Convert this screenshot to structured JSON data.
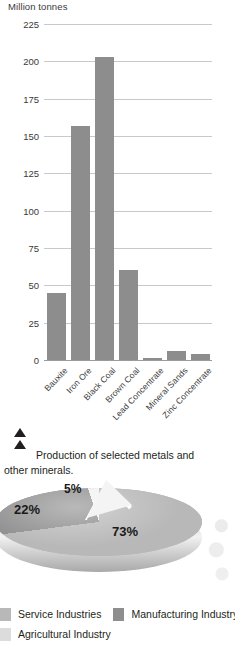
{
  "bar_figure": {
    "axis_title": "Million tonnes",
    "caption": "Production of selected metals and other minerals.",
    "marker_icon": "double-triangle-up-icon"
  },
  "legend": {
    "items": [
      {
        "label": "Service Industries",
        "color": "#b8b8b8"
      },
      {
        "label": "Manufacturing Industry",
        "color": "#8e8e8e"
      },
      {
        "label": "Agricultural Industry",
        "color": "#dcdcdc"
      }
    ]
  },
  "chart_data": [
    {
      "type": "bar",
      "title": "Production of selected metals and other minerals.",
      "xlabel": "",
      "ylabel": "Million tonnes",
      "ylim": [
        0,
        225
      ],
      "yticks": [
        0,
        25,
        50,
        75,
        100,
        125,
        150,
        175,
        200,
        225
      ],
      "grid": true,
      "legend": "none",
      "bar_color": "#8d8d8d",
      "categories": [
        "Bauxite",
        "Iron Ore",
        "Black Coal",
        "Brown Coal",
        "Lead Concentrate",
        "Mineral Sands",
        "Zinc Concentrate"
      ],
      "values": [
        45,
        157,
        203,
        60,
        1.5,
        6,
        4
      ]
    },
    {
      "type": "pie",
      "title": "",
      "labels": [
        "Service Industries",
        "Manufacturing Industry",
        "Agricultural Industry"
      ],
      "values": [
        73,
        22,
        5
      ],
      "data_labels": [
        "73%",
        "22%",
        "5%"
      ],
      "colors": [
        "#b8b8b8",
        "#8e8e8e",
        "#f2f2f2"
      ],
      "exploded": [
        "Agricultural Industry"
      ],
      "three_d": true,
      "legend": "bottom"
    }
  ]
}
